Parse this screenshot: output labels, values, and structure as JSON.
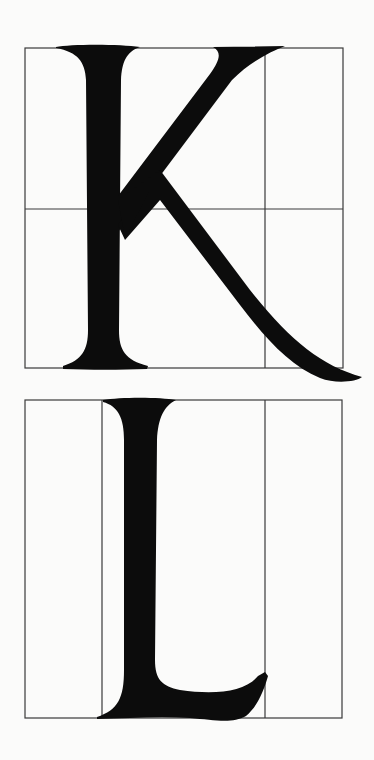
{
  "figure": {
    "letters": [
      {
        "char": "K",
        "grid": {
          "box": {
            "x": 25,
            "y": 48,
            "width": 318,
            "height": 320
          },
          "vertical_dividers_x": [
            265
          ],
          "horizontal_dividers_y": [
            209
          ]
        }
      },
      {
        "char": "L",
        "grid": {
          "box": {
            "x": 25,
            "y": 400,
            "width": 317,
            "height": 318
          },
          "vertical_dividers_x": [
            102,
            265
          ],
          "horizontal_dividers_y": []
        }
      }
    ],
    "colors": {
      "paper": "#fbfbfa",
      "ink": "#0c0c0c",
      "grid_line": "#3a3a3a"
    }
  }
}
